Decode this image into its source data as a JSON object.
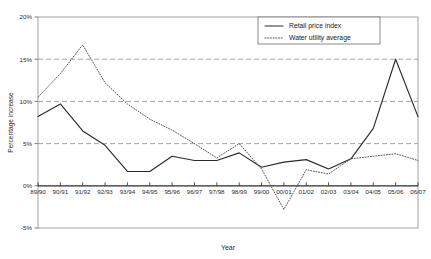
{
  "chart_data": {
    "type": "line",
    "title": "",
    "xlabel": "Year",
    "ylabel": "Percentage increase",
    "categories": [
      "89/90",
      "90/91",
      "91/92",
      "92/93",
      "93/94",
      "94/95",
      "95/96",
      "96/97",
      "97/98",
      "98/99",
      "99/00",
      "00/01",
      "01/02",
      "02/03",
      "03/04",
      "04/05",
      "05/06",
      "06/07"
    ],
    "ylim": [
      -5,
      20
    ],
    "yticks": [
      -5,
      0,
      5,
      10,
      15,
      20
    ],
    "ytick_labels": [
      "-5%",
      "0%",
      "5%",
      "10%",
      "15%",
      "20%"
    ],
    "grid": true,
    "grid_values": [
      5,
      10,
      15
    ],
    "legend_position": "top-right",
    "series": [
      {
        "name": "Retail price index",
        "style": "solid",
        "color": "#2b2b2b",
        "values": [
          8.2,
          9.7,
          6.5,
          4.8,
          1.7,
          1.7,
          3.5,
          3.0,
          3.0,
          3.9,
          2.2,
          2.8,
          3.1,
          2.0,
          3.2,
          6.8,
          15.0,
          8.2
        ]
      },
      {
        "name": "Water utility average",
        "style": "dotted",
        "color": "#555555",
        "values": [
          10.5,
          13.3,
          16.7,
          12.2,
          9.7,
          7.9,
          6.6,
          5.0,
          3.3,
          5.0,
          2.0,
          -2.8,
          1.9,
          1.4,
          3.2,
          3.5,
          3.8,
          3.0
        ]
      }
    ]
  },
  "legend": {
    "items": [
      {
        "label": "Retail price index",
        "style": "solid"
      },
      {
        "label": "Water utility average",
        "style": "dotted"
      }
    ]
  },
  "axis": {
    "x_title": "Year",
    "y_title": "Percentage increase"
  }
}
